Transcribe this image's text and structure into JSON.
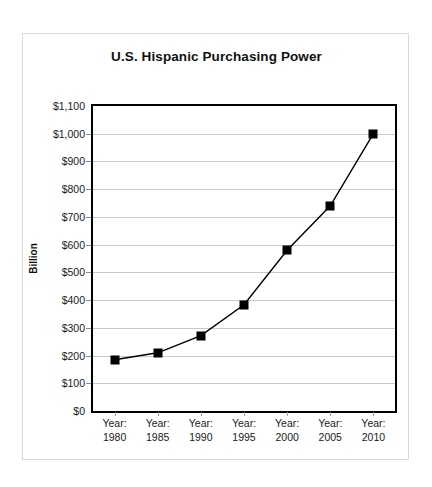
{
  "chart": {
    "title": "U.S. Hispanic Purchasing Power",
    "y_axis_title": "Billion",
    "background": "#ffffff",
    "line_color": "#000000",
    "marker_color": "#000000",
    "gridline_color": "#c8c8c8",
    "axis_color": "#000000"
  },
  "chart_data": {
    "type": "line",
    "title": "U.S. Hispanic Purchasing Power",
    "xlabel": "",
    "ylabel": "Billion",
    "categories": [
      "Year:\n1980",
      "Year:\n1985",
      "Year:\n1990",
      "Year:\n1995",
      "Year:\n2000",
      "Year:\n2005",
      "Year:\n2010"
    ],
    "x": [
      1980,
      1985,
      1990,
      1995,
      2000,
      2005,
      2010
    ],
    "values": [
      185,
      210,
      272,
      383,
      580,
      740,
      1000
    ],
    "ylim": [
      0,
      1100
    ],
    "ytick_values": [
      0,
      100,
      200,
      300,
      400,
      500,
      600,
      700,
      800,
      900,
      1000,
      1100
    ],
    "ytick_labels": [
      "$0",
      "$100",
      "$200",
      "$300",
      "$400",
      "$500",
      "$600",
      "$700",
      "$800",
      "$900",
      "$1,000",
      "$1,100"
    ],
    "xtick_prefix": "Year:",
    "xtick_years": [
      "1980",
      "1985",
      "1990",
      "1995",
      "2000",
      "2005",
      "2010"
    ],
    "grid": true,
    "grid_axis": "y",
    "legend": false,
    "marker": "square",
    "series": [
      {
        "name": "U.S. Hispanic Purchasing Power",
        "values": [
          185,
          210,
          272,
          383,
          580,
          740,
          1000
        ]
      }
    ]
  }
}
